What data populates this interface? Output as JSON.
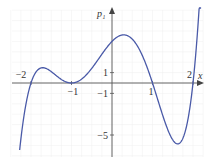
{
  "chart_data": {
    "type": "line",
    "title": "",
    "xlabel": "x",
    "ylabel": "p1",
    "ylabel_display": "p₁",
    "function": "p1(x) = (x+2)(x+1)^2(x-1)(x-2)",
    "x_ticks": [
      {
        "value": -2,
        "label": "−2"
      },
      {
        "value": -1,
        "label": "−1"
      },
      {
        "value": 1,
        "label": "1"
      },
      {
        "value": 2,
        "label": "2"
      }
    ],
    "y_ticks": [
      {
        "value": 1,
        "label": "1"
      },
      {
        "value": -1,
        "label": "−1"
      },
      {
        "value": -5,
        "label": "−5"
      }
    ],
    "xlim": [
      -2.5,
      2.3
    ],
    "ylim": [
      -7,
      7
    ],
    "grid": true,
    "legend": null,
    "series": [
      {
        "name": "p1",
        "color": "#4a5aa8",
        "x": [
          -2.25,
          -2.0,
          -1.75,
          -1.5,
          -1.25,
          -1.0,
          -0.75,
          -0.5,
          -0.25,
          0.0,
          0.25,
          0.5,
          0.75,
          1.0,
          1.25,
          1.5,
          1.75,
          2.0,
          2.15
        ],
        "y": [
          -6.28,
          0.0,
          1.24,
          0.66,
          0.09,
          0.0,
          0.22,
          0.84,
          2.12,
          4.0,
          4.11,
          3.52,
          1.78,
          0.0,
          -2.78,
          -5.47,
          -5.58,
          0.0,
          4.36
        ]
      }
    ],
    "key_points": {
      "roots": [
        -2,
        -1,
        1,
        2
      ],
      "double_root": -1,
      "local_max_left": [
        -1.7,
        1.3
      ],
      "local_max_center": [
        0.3,
        4.4
      ],
      "local_min_right": [
        1.6,
        -5.9
      ],
      "y_intercept": 4
    }
  },
  "axes": {
    "x_label": "x",
    "y_label": "p₁",
    "axis_color": "#555555",
    "grid_color": "#eeeeee"
  }
}
